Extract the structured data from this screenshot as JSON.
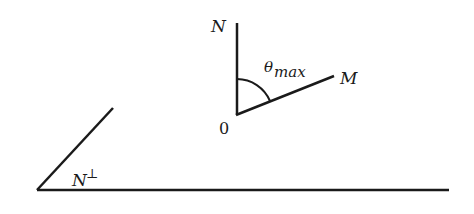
{
  "diagram": {
    "labels": {
      "n": "N",
      "m": "M",
      "origin": "0",
      "theta": "θ",
      "theta_sub": "max",
      "n_perp": "N",
      "perp_sup": "⊥"
    },
    "colors": {
      "stroke": "#1a1a1a",
      "background": "#ffffff"
    }
  }
}
